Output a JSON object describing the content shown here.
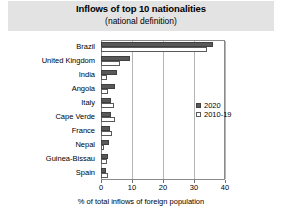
{
  "chart_data": {
    "type": "bar",
    "orientation": "horizontal",
    "title": "Inflows of top 10 nationalities",
    "subtitle": "(national definition)",
    "xlabel": "% of total inflows of foreign population",
    "ylabel": "",
    "xlim": [
      0,
      40
    ],
    "xticks": [
      0,
      10,
      20,
      30,
      40
    ],
    "xtick_labels": [
      "0",
      "10",
      "20",
      "30",
      "40"
    ],
    "grid": true,
    "grid_axis": "x",
    "legend_position": "center right",
    "categories": [
      "Brazil",
      "United Kingdom",
      "India",
      "Angola",
      "Italy",
      "Cape Verde",
      "France",
      "Nepal",
      "Guinea-Bissau",
      "Spain"
    ],
    "series": [
      {
        "name": "2020",
        "color": "#595959",
        "values": [
          36.0,
          9.2,
          5.3,
          4.5,
          3.3,
          3.2,
          2.9,
          2.6,
          2.4,
          1.5
        ]
      },
      {
        "name": "2010-19",
        "color": "#ffffff",
        "values": [
          34.3,
          6.0,
          2.0,
          2.2,
          4.3,
          4.4,
          3.6,
          1.1,
          2.0,
          2.4
        ]
      }
    ]
  },
  "legend": {
    "items": [
      {
        "label": "2020"
      },
      {
        "label": "2010-19"
      }
    ]
  }
}
